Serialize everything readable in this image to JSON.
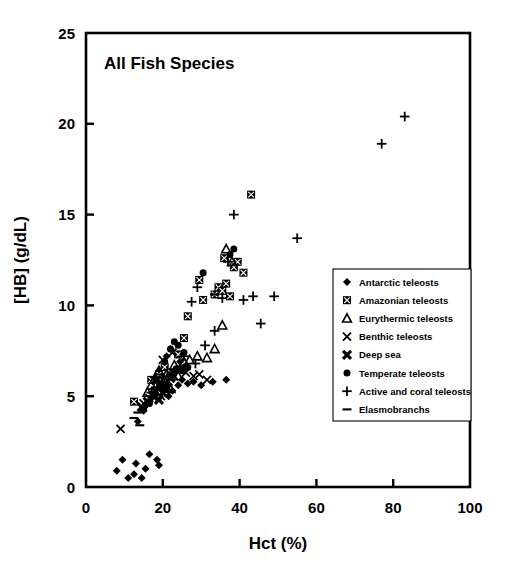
{
  "figure": {
    "title": "All Fish Species",
    "background": "#ffffff",
    "foreground": "#000000"
  },
  "chart_data": {
    "type": "scatter",
    "title": "All Fish Species",
    "xlabel": "Hct (%)",
    "ylabel": "[HB] (g/dL)",
    "xlim": [
      0,
      100
    ],
    "ylim": [
      0,
      25
    ],
    "xticks": [
      "0",
      "20",
      "40",
      "60",
      "80",
      "100"
    ],
    "yticks": [
      "0",
      "5",
      "10",
      "15",
      "20",
      "25"
    ],
    "xtick_values": [
      0,
      20,
      40,
      60,
      80,
      100
    ],
    "ytick_values": [
      0,
      5,
      10,
      15,
      20,
      25
    ],
    "grid": false,
    "legend_position": "center-right",
    "series": [
      {
        "name": "Antarctic teleosts",
        "marker": "diamond",
        "points": [
          [
            8.0,
            0.9
          ],
          [
            9.5,
            1.5
          ],
          [
            11.0,
            0.5
          ],
          [
            12.5,
            0.7
          ],
          [
            13.0,
            1.3
          ],
          [
            14.5,
            0.5
          ],
          [
            15.5,
            1.0
          ],
          [
            16.5,
            1.8
          ],
          [
            18.5,
            1.5
          ],
          [
            19.0,
            1.2
          ],
          [
            13.5,
            3.6
          ],
          [
            15.0,
            4.2
          ],
          [
            16.0,
            4.6
          ],
          [
            17.0,
            4.9
          ],
          [
            18.0,
            5.1
          ],
          [
            19.5,
            5.4
          ],
          [
            20.5,
            5.6
          ],
          [
            21.5,
            5.0
          ],
          [
            22.5,
            5.3
          ],
          [
            24.0,
            5.6
          ],
          [
            25.0,
            5.9
          ],
          [
            26.5,
            5.7
          ],
          [
            28.0,
            5.8
          ],
          [
            30.0,
            5.6
          ],
          [
            33.0,
            5.8
          ],
          [
            36.5,
            5.9
          ],
          [
            23.0,
            6.3
          ],
          [
            25.5,
            6.6
          ],
          [
            21.0,
            7.2
          ],
          [
            22.0,
            7.6
          ],
          [
            24.5,
            6.9
          ],
          [
            19.0,
            6.4
          ],
          [
            17.5,
            5.8
          ]
        ]
      },
      {
        "name": "Amazonian teleosts",
        "marker": "square-crossed",
        "points": [
          [
            12.5,
            4.7
          ],
          [
            17.0,
            5.9
          ],
          [
            19.0,
            6.2
          ],
          [
            20.5,
            6.6
          ],
          [
            22.0,
            6.3
          ],
          [
            24.0,
            7.3
          ],
          [
            25.5,
            8.2
          ],
          [
            26.5,
            9.4
          ],
          [
            29.5,
            11.4
          ],
          [
            30.5,
            10.3
          ],
          [
            33.5,
            10.6
          ],
          [
            34.5,
            11.0
          ],
          [
            35.5,
            10.8
          ],
          [
            36.5,
            11.2
          ],
          [
            37.5,
            10.5
          ],
          [
            38.5,
            12.1
          ],
          [
            39.5,
            12.4
          ],
          [
            41.0,
            11.8
          ],
          [
            43.0,
            16.1
          ],
          [
            36.0,
            12.6
          ]
        ]
      },
      {
        "name": "Eurythermic teleosts",
        "marker": "triangle",
        "points": [
          [
            16.0,
            5.2
          ],
          [
            17.0,
            5.6
          ],
          [
            18.0,
            6.0
          ],
          [
            19.0,
            6.4
          ],
          [
            20.0,
            5.8
          ],
          [
            21.0,
            6.2
          ],
          [
            22.0,
            5.4
          ],
          [
            23.0,
            6.7
          ],
          [
            24.0,
            6.1
          ],
          [
            25.5,
            6.9
          ],
          [
            27.0,
            7.0
          ],
          [
            29.0,
            7.2
          ],
          [
            31.5,
            7.1
          ],
          [
            36.5,
            13.1
          ],
          [
            38.0,
            12.4
          ],
          [
            35.5,
            8.9
          ],
          [
            33.5,
            7.6
          ]
        ]
      },
      {
        "name": "Benthic teleosts",
        "marker": "x-thin",
        "points": [
          [
            9.0,
            3.2
          ],
          [
            15.0,
            4.6
          ],
          [
            16.5,
            4.9
          ],
          [
            18.0,
            5.3
          ],
          [
            19.5,
            5.0
          ],
          [
            20.5,
            5.5
          ],
          [
            21.5,
            5.8
          ],
          [
            23.0,
            6.1
          ],
          [
            24.5,
            6.5
          ],
          [
            26.0,
            6.3
          ],
          [
            28.0,
            6.1
          ],
          [
            29.5,
            6.2
          ],
          [
            31.5,
            5.9
          ],
          [
            22.5,
            7.4
          ],
          [
            20.0,
            7.0
          ]
        ]
      },
      {
        "name": "Deep sea",
        "marker": "x-bold",
        "points": [
          [
            14.5,
            4.4
          ],
          [
            16.0,
            4.7
          ],
          [
            17.5,
            5.0
          ],
          [
            19.0,
            4.8
          ],
          [
            20.0,
            5.2
          ],
          [
            21.0,
            5.4
          ],
          [
            18.5,
            5.9
          ],
          [
            22.0,
            6.0
          ]
        ]
      },
      {
        "name": "Temperate teleosts",
        "marker": "circle",
        "points": [
          [
            15.0,
            4.3
          ],
          [
            16.5,
            4.6
          ],
          [
            18.0,
            5.2
          ],
          [
            19.5,
            5.6
          ],
          [
            21.0,
            5.5
          ],
          [
            22.5,
            6.2
          ],
          [
            23.5,
            6.5
          ],
          [
            25.0,
            6.4
          ],
          [
            26.5,
            6.6
          ],
          [
            22.0,
            7.6
          ],
          [
            23.0,
            8.0
          ],
          [
            24.0,
            7.8
          ],
          [
            25.5,
            7.4
          ],
          [
            30.5,
            11.8
          ],
          [
            37.5,
            12.8
          ],
          [
            38.5,
            13.1
          ],
          [
            20.5,
            6.9
          ]
        ]
      },
      {
        "name": "Active and coral teleosts",
        "marker": "plus",
        "points": [
          [
            17.0,
            5.2
          ],
          [
            18.5,
            5.5
          ],
          [
            20.0,
            5.8
          ],
          [
            21.5,
            6.1
          ],
          [
            23.0,
            6.4
          ],
          [
            24.5,
            6.6
          ],
          [
            26.0,
            6.5
          ],
          [
            28.5,
            6.8
          ],
          [
            31.0,
            7.8
          ],
          [
            33.5,
            8.6
          ],
          [
            35.5,
            10.4
          ],
          [
            37.0,
            12.4
          ],
          [
            38.5,
            15.0
          ],
          [
            41.0,
            10.3
          ],
          [
            43.5,
            10.5
          ],
          [
            45.5,
            9.0
          ],
          [
            49.0,
            10.5
          ],
          [
            55.0,
            13.7
          ],
          [
            77.0,
            18.9
          ],
          [
            83.0,
            20.4
          ],
          [
            27.5,
            10.2
          ],
          [
            29.0,
            11.0
          ],
          [
            25.5,
            7.2
          ]
        ]
      },
      {
        "name": "Elasmobranchs",
        "marker": "dash",
        "points": [
          [
            12.5,
            3.8
          ],
          [
            13.5,
            4.1
          ],
          [
            14.0,
            3.4
          ],
          [
            15.0,
            4.4
          ],
          [
            33.5,
            10.6
          ]
        ]
      }
    ]
  },
  "legend": {
    "entries": [
      {
        "label": "Antarctic teleosts",
        "marker": "diamond"
      },
      {
        "label": "Amazonian teleosts",
        "marker": "square-crossed"
      },
      {
        "label": "Eurythermic teleosts",
        "marker": "triangle"
      },
      {
        "label": "Benthic teleosts",
        "marker": "x-thin"
      },
      {
        "label": "Deep sea",
        "marker": "x-bold"
      },
      {
        "label": "Temperate teleosts",
        "marker": "circle"
      },
      {
        "label": "Active and coral teleosts",
        "marker": "plus"
      },
      {
        "label": "Elasmobranchs",
        "marker": "dash"
      }
    ]
  }
}
